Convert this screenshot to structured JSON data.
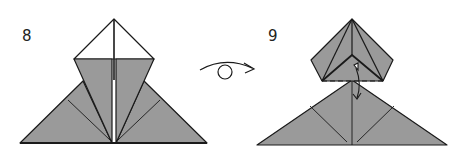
{
  "steps": [
    {
      "number": "8"
    },
    {
      "number": "9"
    }
  ],
  "symbols": {
    "turnover": "turn-over-arrow",
    "fold_unfold": "fold-and-unfold-arrow",
    "valley_fold": "dashed-valley-fold-line"
  },
  "colors": {
    "paper_gray": "#9a9a9a",
    "paper_white": "#ffffff",
    "line": "#1a1a1a"
  }
}
